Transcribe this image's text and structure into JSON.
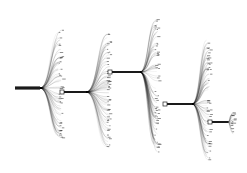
{
  "diagram": {
    "type": "cascading-tree-fanout",
    "title": "",
    "colors": {
      "background": "#ffffff",
      "edge": "#000000",
      "node_fill": "#ffffff",
      "node_stroke": "#222222",
      "trunk": "#1a1a1a"
    },
    "levels": [
      {
        "id": "root",
        "trunk": {
          "x0": 15,
          "x1": 40,
          "y": 88
        },
        "node": null,
        "fan": {
          "x_leaf": 62,
          "y_top": 30,
          "y_bottom": 140,
          "count": 70,
          "seed": 1
        }
      },
      {
        "id": "level1",
        "trunk": {
          "x0": 62,
          "x1": 86,
          "y": 92
        },
        "node": {
          "x": 62,
          "y": 92
        },
        "fan": {
          "x_leaf": 110,
          "y_top": 33,
          "y_bottom": 148,
          "count": 75,
          "seed": 2
        }
      },
      {
        "id": "level2",
        "trunk": {
          "x0": 110,
          "x1": 140,
          "y": 72
        },
        "node": {
          "x": 110,
          "y": 72
        },
        "fan": {
          "x_leaf": 158,
          "y_top": 15,
          "y_bottom": 152,
          "count": 85,
          "seed": 3
        }
      },
      {
        "id": "level3",
        "trunk": {
          "x0": 165,
          "x1": 192,
          "y": 104
        },
        "node": {
          "x": 165,
          "y": 104
        },
        "fan": {
          "x_leaf": 210,
          "y_top": 40,
          "y_bottom": 160,
          "count": 80,
          "seed": 4
        }
      },
      {
        "id": "level4",
        "trunk": {
          "x0": 210,
          "x1": 228,
          "y": 122
        },
        "node": {
          "x": 210,
          "y": 122
        },
        "fan": {
          "x_leaf": 234,
          "y_top": 112,
          "y_bottom": 134,
          "count": 25,
          "seed": 5
        }
      }
    ],
    "labels_note": "leaf labels are illegibly small at this resolution"
  }
}
